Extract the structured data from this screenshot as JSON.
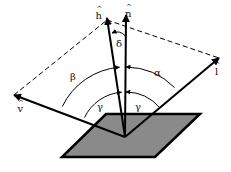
{
  "diagram": {
    "vectors": [
      {
        "id": "h",
        "label": "h",
        "hat": "^",
        "name": "halfway vector"
      },
      {
        "id": "n",
        "label": "n",
        "hat": "^",
        "name": "surface normal"
      },
      {
        "id": "v",
        "label": "v",
        "hat": "^",
        "name": "view vector"
      },
      {
        "id": "l",
        "label": "l",
        "hat": "^",
        "name": "light vector"
      }
    ],
    "angles": {
      "delta": "δ",
      "beta": "β",
      "alpha": "α",
      "gamma_left": "γ",
      "gamma_right": "γ"
    },
    "colors": {
      "surface_fill": "#8a8a8a",
      "stroke": "#000000",
      "background": "#ffffff"
    }
  }
}
